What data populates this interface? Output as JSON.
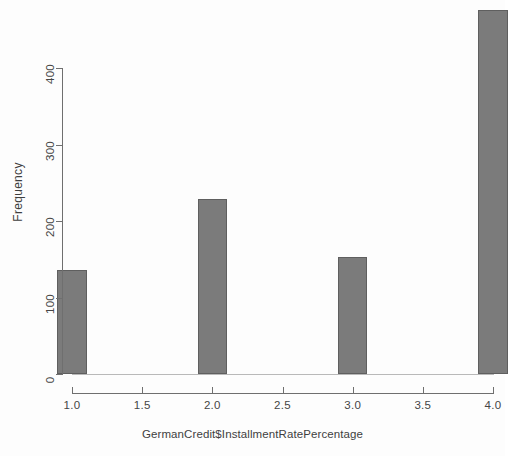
{
  "chart_data": {
    "type": "bar",
    "title": "",
    "subtitle": "",
    "xlabel": "GermanCredit$InstallmentRatePercentage",
    "ylabel": "Frequency",
    "categories": [
      "1",
      "2",
      "3",
      "4"
    ],
    "values": [
      136,
      229,
      153,
      476
    ],
    "x": [
      1,
      2,
      3,
      4
    ],
    "bar_width_units": 0.21,
    "xlim": [
      1.0,
      4.0
    ],
    "ylim": [
      0,
      476
    ],
    "xticks": [
      "1.0",
      "1.5",
      "2.0",
      "2.5",
      "3.0",
      "3.5",
      "4.0"
    ],
    "xtick_values": [
      1.0,
      1.5,
      2.0,
      2.5,
      3.0,
      3.5,
      4.0
    ],
    "yticks": [
      "0",
      "100",
      "200",
      "300",
      "400"
    ],
    "ytick_values": [
      0,
      100,
      200,
      300,
      400
    ],
    "grid": false,
    "legend": false,
    "legend_position": "none",
    "bar_fill_color": "#7b7b7b",
    "bar_border_color": "#5f5f5f",
    "axis_color": "#6f6f6f",
    "background_color": "#fdfdfd",
    "text_color": "#3f3f3f"
  }
}
